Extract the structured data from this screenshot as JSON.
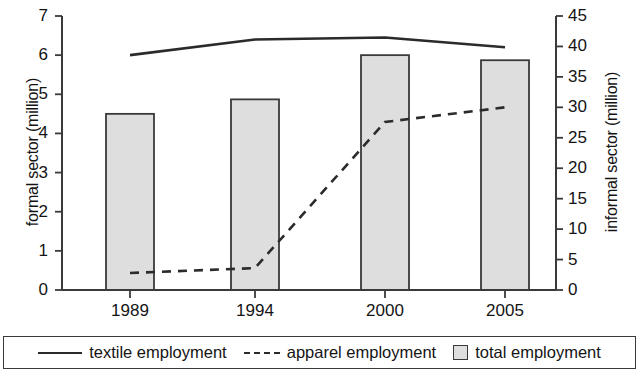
{
  "chart_data": {
    "type": "bar",
    "title": "",
    "categories": [
      "1989",
      "1994",
      "2000",
      "2005"
    ],
    "xlabel": "",
    "ylabel": "formal sector (million)",
    "y2label": "informal sector (million)",
    "ylim": [
      0,
      7
    ],
    "y2lim": [
      0,
      45
    ],
    "yticks": [
      "0",
      "1",
      "2",
      "3",
      "4",
      "5",
      "6",
      "7"
    ],
    "y2ticks": [
      "0",
      "5",
      "10",
      "15",
      "20",
      "25",
      "30",
      "35",
      "40",
      "45"
    ],
    "grid": false,
    "legend_position": "bottom",
    "series": [
      {
        "name": "total employment",
        "type": "bar",
        "axis": "left",
        "color": "#dedede",
        "edge_color": "#3a3a3a",
        "values": [
          4.5,
          4.87,
          6.0,
          5.87
        ]
      },
      {
        "name": "textile employment",
        "type": "line",
        "style": "solid",
        "axis": "left",
        "color": "#2b2b2b",
        "values": [
          6.0,
          6.4,
          6.45,
          6.2
        ]
      },
      {
        "name": "apparel employment",
        "type": "line",
        "style": "dashed",
        "axis": "right",
        "color": "#2b2b2b",
        "values": [
          2.8,
          3.6,
          27.6,
          30.0
        ]
      }
    ]
  },
  "legend": {
    "items": [
      {
        "label": "textile employment",
        "marker": "solid-line"
      },
      {
        "label": "apparel employment",
        "marker": "dashed-line"
      },
      {
        "label": "total employment",
        "marker": "gray-square"
      }
    ]
  }
}
